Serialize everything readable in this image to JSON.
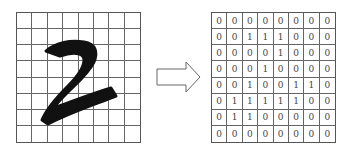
{
  "left_panel": {
    "description": "Handwritten digit 2 over 8x8 grid",
    "digit": "2",
    "rows": 8,
    "cols": 8
  },
  "arrow": {
    "direction": "right"
  },
  "right_panel": {
    "rows": 8,
    "cols": 8,
    "matrix": [
      [
        0,
        0,
        0,
        0,
        0,
        0,
        0,
        0
      ],
      [
        0,
        0,
        1,
        1,
        1,
        0,
        0,
        0
      ],
      [
        0,
        0,
        0,
        0,
        1,
        0,
        0,
        0
      ],
      [
        0,
        0,
        0,
        1,
        0,
        0,
        0,
        0
      ],
      [
        0,
        0,
        1,
        0,
        0,
        1,
        1,
        0
      ],
      [
        0,
        1,
        1,
        1,
        1,
        1,
        0,
        0
      ],
      [
        0,
        1,
        1,
        0,
        0,
        0,
        0,
        0
      ],
      [
        0,
        0,
        0,
        0,
        0,
        0,
        0,
        0
      ]
    ]
  }
}
